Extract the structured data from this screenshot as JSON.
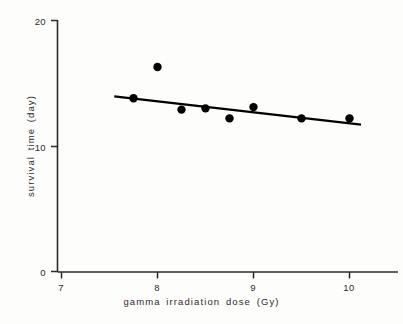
{
  "chart_data": {
    "type": "scatter",
    "title": "",
    "xlabel": "gamma irradiation dose (Gy)",
    "ylabel": "survival time (day)",
    "xlim": [
      7,
      10.35
    ],
    "ylim": [
      0,
      20
    ],
    "grid": false,
    "legend": "none",
    "x_ticks": [
      "7",
      "8",
      "9",
      "10"
    ],
    "x_tick_values": [
      7,
      8,
      9,
      10
    ],
    "y_ticks": [
      "0",
      "10",
      "20"
    ],
    "y_tick_values": [
      0,
      10,
      20
    ],
    "series": [
      {
        "name": "observed survival time",
        "marker": "filled-circle",
        "color": "#000000",
        "x": [
          7.75,
          8.0,
          8.25,
          8.5,
          8.75,
          9.0,
          9.5,
          10.0
        ],
        "y": [
          13.8,
          16.3,
          12.9,
          13.0,
          12.2,
          13.1,
          12.2,
          12.2
        ]
      },
      {
        "name": "fitted regression line",
        "marker": "none",
        "type": "line",
        "color": "#000000",
        "x": [
          7.55,
          10.12
        ],
        "y": [
          13.95,
          11.7
        ]
      }
    ]
  },
  "axes": {
    "x_tick_labels": [
      "7",
      "8",
      "9",
      "10"
    ],
    "y_tick_labels": [
      "20",
      "10",
      "0"
    ],
    "x_title": "gamma irradiation dose (Gy)",
    "y_title": "survival time (day)"
  },
  "colors": {
    "axis": "#2b2b2b",
    "marker": "#000000",
    "line": "#000000",
    "background": "#fdfdfb"
  }
}
